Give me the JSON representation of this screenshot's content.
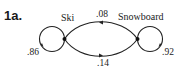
{
  "problem": {
    "label": "1a."
  },
  "diagram": {
    "type": "markov-transition-diagram",
    "states": [
      {
        "id": "ski",
        "label": "Ski"
      },
      {
        "id": "snowboard",
        "label": "Snowboard"
      }
    ],
    "transitions": [
      {
        "from": "ski",
        "to": "ski",
        "probability": ".86"
      },
      {
        "from": "snowboard",
        "to": "ski",
        "probability": ".08"
      },
      {
        "from": "ski",
        "to": "snowboard",
        "probability": ".14"
      },
      {
        "from": "snowboard",
        "to": "snowboard",
        "probability": ".92"
      }
    ],
    "colors": {
      "line": "#222222",
      "text": "#222222"
    }
  }
}
